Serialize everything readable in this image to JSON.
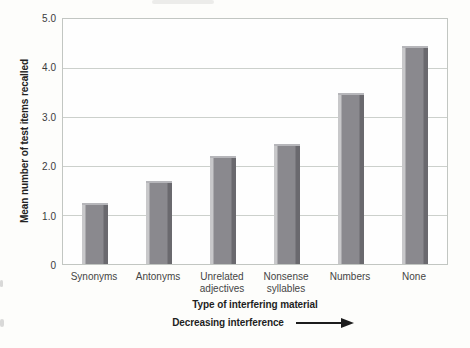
{
  "figure": {
    "y_axis_title": "Mean number of test items recalled",
    "x_axis_title": "Type of interfering material",
    "annotation_text": "Decreasing interference",
    "arrow_icon": "right-arrow"
  },
  "chart_data": {
    "type": "bar",
    "categories": [
      "Synonyms",
      "Antonyms",
      "Unrelated adjectives",
      "Nonsense syllables",
      "Numbers",
      "None"
    ],
    "values": [
      1.25,
      1.7,
      2.2,
      2.45,
      3.5,
      4.45
    ],
    "title": "",
    "xlabel": "Type of interfering material",
    "ylabel": "Mean number of test items recalled",
    "ylim": [
      0,
      5
    ],
    "yticks": [
      {
        "label": "5.0",
        "value": 5
      },
      {
        "label": "4.0",
        "value": 4
      },
      {
        "label": "3.0",
        "value": 3
      },
      {
        "label": "2.0",
        "value": 2
      },
      {
        "label": "1.0",
        "value": 1
      },
      {
        "label": "0",
        "value": 0
      }
    ],
    "grid": true,
    "legend": "none",
    "annotation": "Decreasing interference",
    "colors": {
      "bar_body": "#8a898e",
      "bar_edge_dark": "#6a696e",
      "bar_edge_light": "#c8c8ca",
      "bar_top_cap": "#b6b6ba",
      "gridline": "#ccd0cc",
      "plot_border": "#c2c6c2",
      "text_dark": "#1f1f1f",
      "text_gray": "#454545",
      "background": "#fdfdfb"
    }
  }
}
